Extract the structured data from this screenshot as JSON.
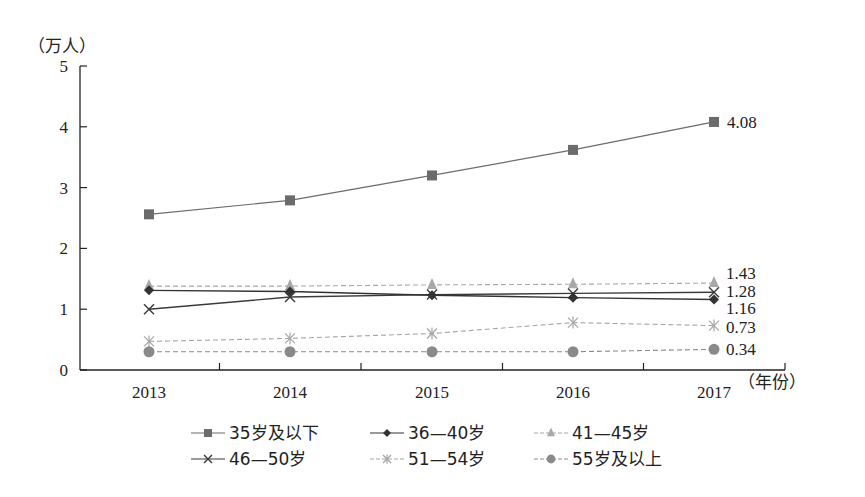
{
  "chart_data": {
    "type": "line",
    "title": "",
    "ylabel": "（万人）",
    "xlabel": "（年份）",
    "ylim": [
      0,
      5
    ],
    "yticks": [
      0,
      1,
      2,
      3,
      4,
      5
    ],
    "grid": false,
    "legend_position": "bottom",
    "categories": [
      "2013",
      "2014",
      "2015",
      "2016",
      "2017"
    ],
    "series": [
      {
        "name": "35岁及以下",
        "values": [
          2.56,
          2.79,
          3.2,
          3.62,
          4.08
        ],
        "marker": "square",
        "color": "#6b6b6b",
        "line": "solid",
        "end_label": "4.08"
      },
      {
        "name": "36—40岁",
        "values": [
          1.31,
          1.29,
          1.23,
          1.19,
          1.16
        ],
        "marker": "diamond",
        "color": "#333333",
        "line": "solid",
        "end_label": "1.16"
      },
      {
        "name": "41—45岁",
        "values": [
          1.38,
          1.38,
          1.4,
          1.41,
          1.43
        ],
        "marker": "triangle",
        "color": "#a8a8a8",
        "line": "dashed",
        "end_label": "1.43"
      },
      {
        "name": "46—50岁",
        "values": [
          1.0,
          1.2,
          1.24,
          1.26,
          1.28
        ],
        "marker": "x",
        "color": "#3a3a3a",
        "line": "solid",
        "end_label": "1.28"
      },
      {
        "name": "51—54岁",
        "values": [
          0.47,
          0.52,
          0.6,
          0.78,
          0.73
        ],
        "marker": "asterisk",
        "color": "#a5a5a5",
        "line": "dashed",
        "end_label": "0.73"
      },
      {
        "name": "55岁及以上",
        "values": [
          0.3,
          0.3,
          0.3,
          0.3,
          0.34
        ],
        "marker": "circle",
        "color": "#8a8a8a",
        "line": "dashed",
        "end_label": "0.34"
      }
    ]
  }
}
